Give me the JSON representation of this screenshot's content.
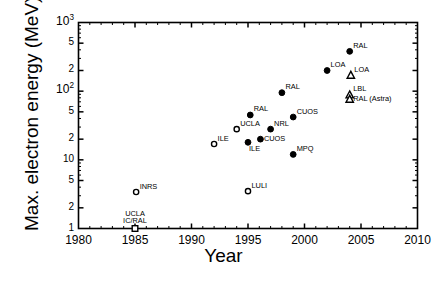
{
  "chart_data": {
    "type": "scatter",
    "title": "",
    "xlabel": "Year",
    "ylabel": "Max. electron energy (MeV)",
    "xlim": [
      1980,
      2010
    ],
    "ylim": [
      1,
      1000
    ],
    "yscale": "log",
    "xscale": "linear",
    "grid": false,
    "legend": "none",
    "xticks": [
      1980,
      1985,
      1990,
      1995,
      2000,
      2005,
      2010
    ],
    "xtick_labels": [
      "1980",
      "1985",
      "1990",
      "1995",
      "2000",
      "2005",
      "2010"
    ],
    "yticks": [
      1,
      2,
      5,
      10,
      20,
      50,
      100,
      200,
      500,
      1000
    ],
    "ytick_labels": [
      "1",
      "2",
      "5",
      "10",
      "5",
      "2",
      "10",
      "2",
      "5",
      "10"
    ],
    "ytick_major_labels": [
      {
        "value": 1,
        "text": "1"
      },
      {
        "value": 2,
        "text": "2"
      },
      {
        "value": 5,
        "text": "5"
      },
      {
        "value": 10,
        "text": "10"
      },
      {
        "value": 20,
        "text": "2"
      },
      {
        "value": 50,
        "text": "5"
      },
      {
        "value": 100,
        "text": "10",
        "exp": "2"
      },
      {
        "value": 200,
        "text": "2"
      },
      {
        "value": 500,
        "text": "5"
      },
      {
        "value": 1000,
        "text": "10",
        "exp": "3"
      }
    ],
    "marker_types": [
      "filled-circle",
      "open-circle",
      "open-triangle",
      "open-square"
    ],
    "points": [
      {
        "label": "UCLA\nIC/RAL",
        "x": 1985.0,
        "y": 1.0,
        "marker": "open-square",
        "label_pos": "above"
      },
      {
        "label": "INRS",
        "x": 1985.1,
        "y": 3.4,
        "marker": "open-circle",
        "label_pos": "right-up"
      },
      {
        "label": "LULI",
        "x": 1995.0,
        "y": 3.5,
        "marker": "open-circle",
        "label_pos": "right-up"
      },
      {
        "label": "ILE",
        "x": 1992.0,
        "y": 17.0,
        "marker": "open-circle",
        "label_pos": "right-up"
      },
      {
        "label": "UCLA",
        "x": 1994.0,
        "y": 28.0,
        "marker": "open-circle",
        "label_pos": "right-up"
      },
      {
        "label": "ILE",
        "x": 1995.0,
        "y": 18.0,
        "marker": "filled-circle",
        "label_pos": "below-right"
      },
      {
        "label": "RAL",
        "x": 1995.2,
        "y": 45.0,
        "marker": "filled-circle",
        "label_pos": "right-up"
      },
      {
        "label": "CUOS",
        "x": 1996.1,
        "y": 20.0,
        "marker": "filled-circle",
        "label_pos": "right"
      },
      {
        "label": "NRL",
        "x": 1997.0,
        "y": 28.0,
        "marker": "filled-circle",
        "label_pos": "right-up"
      },
      {
        "label": "RAL",
        "x": 1998.0,
        "y": 95.0,
        "marker": "filled-circle",
        "label_pos": "right-up"
      },
      {
        "label": "CUOS",
        "x": 1999.0,
        "y": 42.0,
        "marker": "filled-circle",
        "label_pos": "right-up"
      },
      {
        "label": "MPQ",
        "x": 1999.0,
        "y": 12.0,
        "marker": "filled-circle",
        "label_pos": "right-up"
      },
      {
        "label": "LOA",
        "x": 2002.0,
        "y": 200.0,
        "marker": "filled-circle",
        "label_pos": "right-up"
      },
      {
        "label": "RAL",
        "x": 2004.0,
        "y": 380.0,
        "marker": "filled-circle",
        "label_pos": "right-up"
      },
      {
        "label": "LOA",
        "x": 2004.1,
        "y": 170.0,
        "marker": "open-triangle",
        "label_pos": "right-up"
      },
      {
        "label": "LBL",
        "x": 2004.0,
        "y": 88.0,
        "marker": "open-triangle",
        "label_pos": "right-up"
      },
      {
        "label": "RAL (Astra)",
        "x": 2004.0,
        "y": 76.0,
        "marker": "open-triangle",
        "label_pos": "right"
      }
    ]
  },
  "axes": {
    "x_title": "Year",
    "y_title": "Max. electron energy (MeV)"
  }
}
